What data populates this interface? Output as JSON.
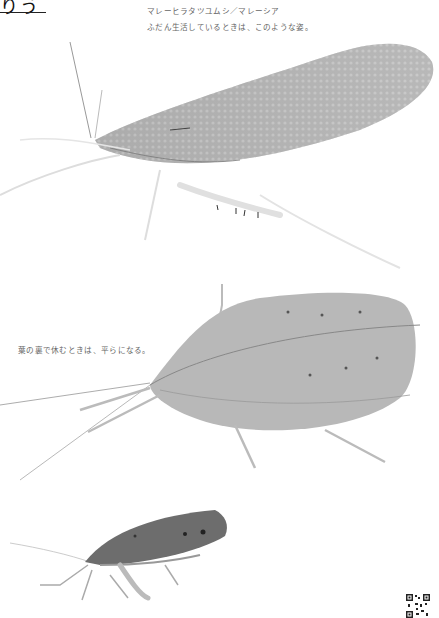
{
  "page": {
    "heading_fragment": "りう",
    "background": "#ffffff"
  },
  "captions": {
    "species_location": "マレーヒラタツユムシ／マレーシア",
    "normal_pose": "ふだん生活しているときは、このような姿。",
    "resting_pose": "葉の裏で休むときは、平らになる。"
  },
  "photos": [
    {
      "name": "insect-normal-pose",
      "description": "leaf katydid standing, side view"
    },
    {
      "name": "insect-flat-pose",
      "description": "leaf katydid flattened, top view"
    },
    {
      "name": "insect-side-view",
      "description": "leaf katydid side view, darker"
    }
  ],
  "qr_code": {
    "label": "qr-code"
  }
}
